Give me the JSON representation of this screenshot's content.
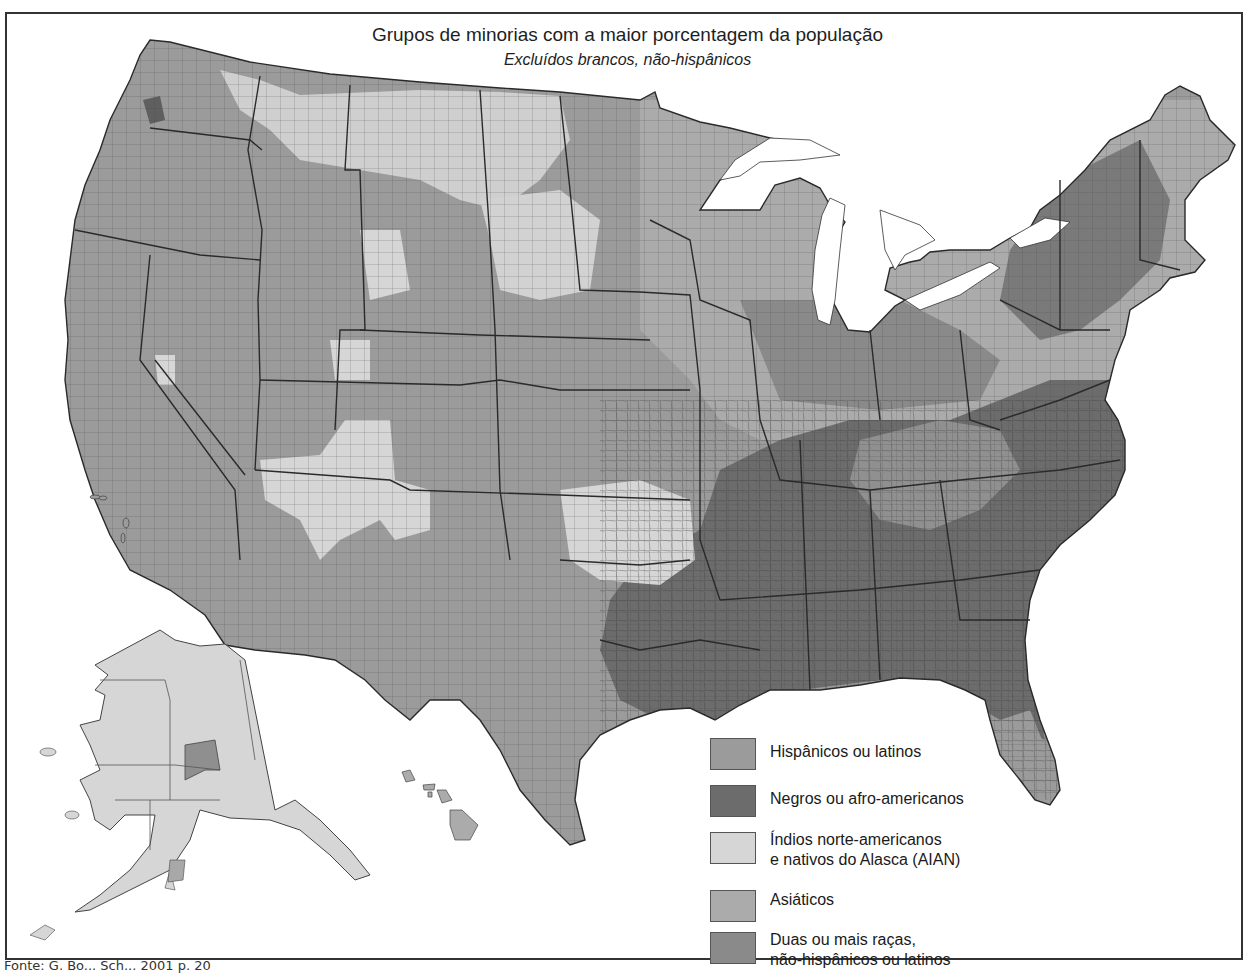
{
  "title": "Grupos de minorias com a maior porcentagem da população",
  "subtitle": "Excluídos brancos, não-hispânicos",
  "legend": [
    {
      "key": "hispanic",
      "label_lines": [
        "Hispânicos ou latinos"
      ],
      "color": "#9b9b9b"
    },
    {
      "key": "black",
      "label_lines": [
        "Negros ou afro-americanos"
      ],
      "color": "#6c6c6c"
    },
    {
      "key": "aian",
      "label_lines": [
        "Índios norte-americanos",
        "e nativos do Alasca (AIAN)"
      ],
      "color": "#d6d6d6"
    },
    {
      "key": "asian",
      "label_lines": [
        "Asiáticos"
      ],
      "color": "#ababab"
    },
    {
      "key": "two_or_more",
      "label_lines": [
        "Duas ou mais raças,",
        "não-hispânicos ou latinos"
      ],
      "color": "#8a8a8a"
    }
  ],
  "source": "Fonte: G. Bo... Sch... 2001 p. 20",
  "map": {
    "regions": [
      "Estados Unidos contíguos",
      "Alasca",
      "Havaí"
    ],
    "dominant_by_region": {
      "west_southwest": "hispanic",
      "southeast": "black",
      "northern_plains_oklahoma": "aian",
      "alaska": "aian",
      "hawaii": "asian",
      "midwest_northeast": "mixed"
    }
  }
}
